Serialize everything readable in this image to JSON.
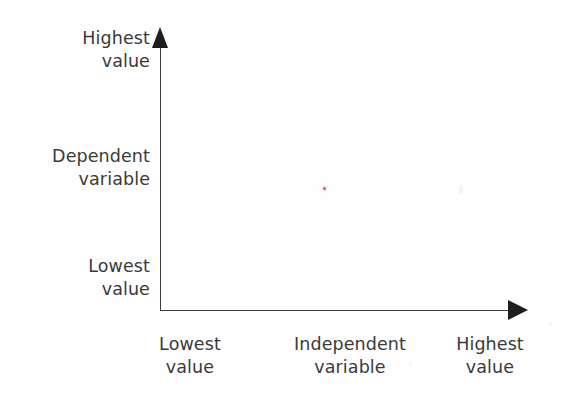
{
  "figure": {
    "caption": "",
    "background_color": "#fefefe",
    "axis_color": "#3d3d3d",
    "text_color": "#3b3a3a",
    "marker_color": "#d2376b"
  },
  "y_axis": {
    "name": "Dependent variable",
    "high_label": "Highest\nvalue",
    "mid_label": "Dependent\nvariable",
    "low_label": "Lowest\nvalue",
    "arrow_direction": "up"
  },
  "x_axis": {
    "name": "Independent variable",
    "low_label": "Lowest\nvalue",
    "mid_label": "Independent\nvariable",
    "high_label": "Highest\nvalue",
    "arrow_direction": "right"
  },
  "chart_data": {
    "type": "scatter",
    "title": "",
    "xlabel": "Independent variable",
    "ylabel": "Dependent variable",
    "grid": false,
    "legend_position": "none",
    "xlim": [
      0,
      1
    ],
    "ylim": [
      0,
      1
    ],
    "x_tick_labels": [
      "Lowest value",
      "Highest value"
    ],
    "y_tick_labels": [
      "Lowest value",
      "Highest value"
    ],
    "axis_style": "arrow-terminated open axes (no spine box, no ticks)",
    "series": [
      {
        "name": "stray mark",
        "color": "#d2376b",
        "x": [
          0.46
        ],
        "y": [
          0.46
        ],
        "point_count": 1,
        "note": "single faint red speck near centre of plot area"
      }
    ],
    "annotations": []
  }
}
